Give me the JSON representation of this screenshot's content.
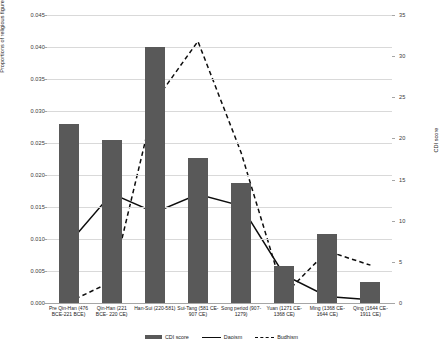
{
  "chart_data": {
    "type": "bar",
    "title": "",
    "xlabel": "",
    "ylabel": "Proportions of religious figures",
    "y2label": "CDI score",
    "grid": true,
    "legend_position": "bottom",
    "ylim": [
      0,
      0.045
    ],
    "y2lim": [
      0,
      35
    ],
    "yticks": [
      "0.000",
      "0.005",
      "0.010",
      "0.015",
      "0.020",
      "0.025",
      "0.030",
      "0.035",
      "0.040",
      "0.045"
    ],
    "ytick_values": [
      0,
      0.005,
      0.01,
      0.015,
      0.02,
      0.025,
      0.03,
      0.035,
      0.04,
      0.045
    ],
    "y2ticks": [
      "0",
      "5",
      "10",
      "15",
      "20",
      "25",
      "30",
      "35"
    ],
    "y2tick_values": [
      0,
      5,
      10,
      15,
      20,
      25,
      30,
      35
    ],
    "categories": [
      "Pre Qin-Han (476 BCE-221 BCE)",
      "Qin-Han (221 BCE- 220 CE)",
      "Han-Sui (220-581)",
      "Sui-Tang (581 CE-907 CE)",
      "Song period (907-1279)",
      "Yuan (1271 CE-1368 CE)",
      "Ming (1368 CE-1644 CE)",
      "Qing (1644 CE-1911 CE)"
    ],
    "series": [
      {
        "name": "CDI score",
        "type": "bar",
        "axis": "left",
        "color": "#595959",
        "values": [
          0.028,
          0.0254,
          0.04,
          0.0226,
          0.0188,
          0.0058,
          0.0108,
          0.0033
        ]
      },
      {
        "name": "Daoism",
        "type": "line",
        "style": "solid",
        "axis": "right",
        "color": "#0d0d0d",
        "values": [
          7.2,
          13.3,
          11.0,
          13.2,
          11.8,
          3.4,
          0.8,
          0.4
        ]
      },
      {
        "name": "Budhism",
        "type": "line",
        "style": "dashed",
        "axis": "right",
        "color": "#0d0d0d",
        "values": [
          0.1,
          2.6,
          24.5,
          31.8,
          18.3,
          1.0,
          6.3,
          4.6
        ]
      }
    ]
  },
  "legend": {
    "items": [
      {
        "label": "CDI score",
        "marker": "bar-swatch"
      },
      {
        "label": "Daoism",
        "marker": "solid-line-swatch"
      },
      {
        "label": "Budhism",
        "marker": "dashed-line-swatch"
      }
    ]
  }
}
